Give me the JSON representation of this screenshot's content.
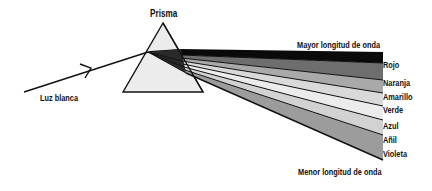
{
  "title": "Prisma",
  "incoming_light": {
    "label": "Luz blanca"
  },
  "top_note": "Mayor longitud de onda",
  "bottom_note": "Menor longitud de onda",
  "spectrum": [
    {
      "name": "Rojo",
      "fill": "#0a0a0a"
    },
    {
      "name": "Naranja",
      "fill": "#6e6e6e"
    },
    {
      "name": "Amarillo",
      "fill": "#a9a9a9"
    },
    {
      "name": "Verde",
      "fill": "#d9d9d9"
    },
    {
      "name": "Azul",
      "fill": "#ececec"
    },
    {
      "name": "Añil",
      "fill": "#d2d2d2"
    },
    {
      "name": "Violeta",
      "fill": "#9c9c9c"
    }
  ],
  "colors": {
    "prism_fill": "#ececec",
    "stroke": "#111111",
    "background": "#ffffff"
  }
}
